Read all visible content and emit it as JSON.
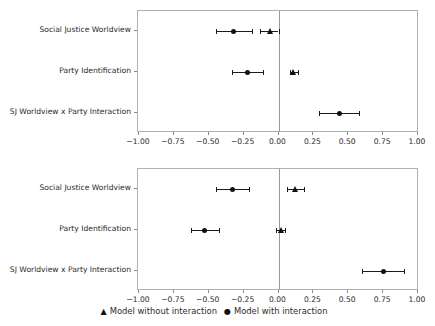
{
  "figure": {
    "legend": {
      "entries": [
        {
          "symbol": "▲",
          "marker": "triangle",
          "label": "Model without interaction"
        },
        {
          "symbol": "●",
          "marker": "circle",
          "label": "Model with interaction"
        }
      ]
    },
    "colors": {
      "marker": "#111111",
      "errorbar": "#1a1a1a",
      "axis": "#b0b0b0",
      "zero_line": "#9a9a9a",
      "text": "#2b2b2b",
      "background": "#ffffff"
    }
  },
  "chart_data": [
    {
      "type": "scatter",
      "panel": "top",
      "title": "",
      "xlabel": "",
      "ylabel": "",
      "xlim": [
        -1.0,
        1.0
      ],
      "xticks": [
        -1.0,
        -0.75,
        -0.5,
        -0.25,
        0.0,
        0.25,
        0.5,
        0.75,
        1.0
      ],
      "xticklabels": [
        "-1.00",
        "-0.75",
        "-0.50",
        "-0.25",
        "0.00",
        "0.25",
        "0.50",
        "0.75",
        "1.00"
      ],
      "categories": [
        "Social Justice Worldview",
        "Party Identification",
        "SJ Worldview x Party Interaction"
      ],
      "grid": false,
      "zero_line": 0.0,
      "legend_position": "below-figure",
      "series": [
        {
          "name": "Model without interaction",
          "marker": "triangle",
          "values": [
            -0.06,
            0.11,
            null
          ],
          "ci_low": [
            -0.13,
            0.08,
            null
          ],
          "ci_high": [
            0.0,
            0.14,
            null
          ]
        },
        {
          "name": "Model with interaction",
          "marker": "circle",
          "values": [
            -0.32,
            -0.22,
            0.44
          ],
          "ci_low": [
            -0.45,
            -0.33,
            0.29
          ],
          "ci_high": [
            -0.19,
            -0.11,
            0.58
          ]
        }
      ]
    },
    {
      "type": "scatter",
      "panel": "bottom",
      "title": "",
      "xlabel": "",
      "ylabel": "",
      "xlim": [
        -1.0,
        1.0
      ],
      "xticks": [
        -1.0,
        -0.75,
        -0.5,
        -0.25,
        0.0,
        0.25,
        0.5,
        0.75,
        1.0
      ],
      "xticklabels": [
        "-1.00",
        "-0.75",
        "-0.50",
        "-0.25",
        "0.00",
        "0.25",
        "0.50",
        "0.75",
        "1.00"
      ],
      "categories": [
        "Social Justice Worldview",
        "Party Identification",
        "SJ Worldview x Party Interaction"
      ],
      "grid": false,
      "zero_line": 0.0,
      "legend_position": "below-figure",
      "series": [
        {
          "name": "Model without interaction",
          "marker": "triangle",
          "values": [
            0.12,
            0.02,
            null
          ],
          "ci_low": [
            0.06,
            -0.02,
            null
          ],
          "ci_high": [
            0.18,
            0.05,
            null
          ]
        },
        {
          "name": "Model with interaction",
          "marker": "circle",
          "values": [
            -0.33,
            -0.53,
            0.75
          ],
          "ci_low": [
            -0.45,
            -0.63,
            0.6
          ],
          "ci_high": [
            -0.21,
            -0.43,
            0.9
          ]
        }
      ]
    }
  ]
}
